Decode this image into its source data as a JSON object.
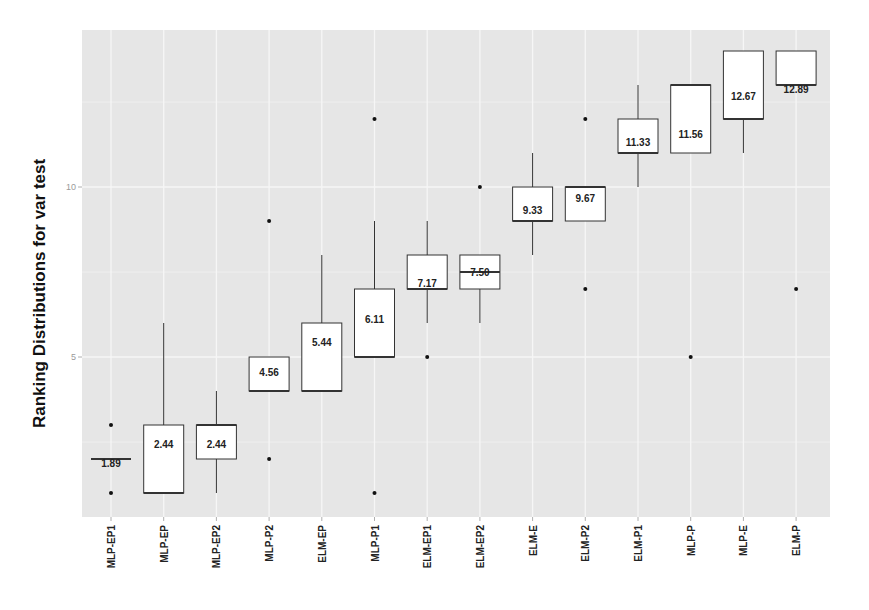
{
  "chart_data": {
    "type": "boxplot",
    "title": "",
    "xlabel": "",
    "ylabel": "Ranking Distributions for var test",
    "ylim": [
      0.3,
      14.5
    ],
    "yticks": [
      5,
      10
    ],
    "grid": true,
    "legend": null,
    "categories": [
      "MLP-EP1",
      "MLP-EP",
      "MLP-EP2",
      "MLP-P2",
      "ELM-EP",
      "MLP-P1",
      "ELM-EP1",
      "ELM-EP2",
      "ELM-E",
      "ELM-P2",
      "ELM-P1",
      "MLP-P",
      "MLP-E",
      "ELM-P"
    ],
    "boxes": [
      {
        "name": "MLP-EP1",
        "q1": 2,
        "median": 2,
        "q3": 2,
        "whisker_low": 2,
        "whisker_high": 2,
        "outliers": [
          1,
          3
        ],
        "mean_label": "1.89"
      },
      {
        "name": "MLP-EP",
        "q1": 1,
        "median": 1,
        "q3": 3,
        "whisker_low": 1,
        "whisker_high": 6,
        "outliers": [],
        "mean_label": "2.44"
      },
      {
        "name": "MLP-EP2",
        "q1": 2,
        "median": 3,
        "q3": 3,
        "whisker_low": 1,
        "whisker_high": 4,
        "outliers": [],
        "mean_label": "2.44"
      },
      {
        "name": "MLP-P2",
        "q1": 4,
        "median": 4,
        "q3": 5,
        "whisker_low": 4,
        "whisker_high": 5,
        "outliers": [
          2,
          9
        ],
        "mean_label": "4.56"
      },
      {
        "name": "ELM-EP",
        "q1": 4,
        "median": 4,
        "q3": 6,
        "whisker_low": 4,
        "whisker_high": 8,
        "outliers": [],
        "mean_label": "5.44"
      },
      {
        "name": "MLP-P1",
        "q1": 5,
        "median": 5,
        "q3": 7,
        "whisker_low": 5,
        "whisker_high": 9,
        "outliers": [
          1,
          12
        ],
        "mean_label": "6.11"
      },
      {
        "name": "ELM-EP1",
        "q1": 7,
        "median": 7,
        "q3": 8,
        "whisker_low": 6,
        "whisker_high": 9,
        "outliers": [
          5
        ],
        "mean_label": "7.17"
      },
      {
        "name": "ELM-EP2",
        "q1": 7,
        "median": 7.5,
        "q3": 8,
        "whisker_low": 6,
        "whisker_high": 8,
        "outliers": [
          10
        ],
        "mean_label": "7.50"
      },
      {
        "name": "ELM-E",
        "q1": 9,
        "median": 9,
        "q3": 10,
        "whisker_low": 8,
        "whisker_high": 11,
        "outliers": [],
        "mean_label": "9.33"
      },
      {
        "name": "ELM-P2",
        "q1": 9,
        "median": 10,
        "q3": 10,
        "whisker_low": 9,
        "whisker_high": 10,
        "outliers": [
          7,
          12
        ],
        "mean_label": "9.67"
      },
      {
        "name": "ELM-P1",
        "q1": 11,
        "median": 11,
        "q3": 12,
        "whisker_low": 10,
        "whisker_high": 13,
        "outliers": [],
        "mean_label": "11.33"
      },
      {
        "name": "MLP-P",
        "q1": 11,
        "median": 13,
        "q3": 13,
        "whisker_low": 11,
        "whisker_high": 13,
        "outliers": [
          5
        ],
        "mean_label": "11.56"
      },
      {
        "name": "MLP-E",
        "q1": 12,
        "median": 12,
        "q3": 14,
        "whisker_low": 11,
        "whisker_high": 14,
        "outliers": [],
        "mean_label": "12.67"
      },
      {
        "name": "ELM-P",
        "q1": 13,
        "median": 13,
        "q3": 14,
        "whisker_low": 13,
        "whisker_high": 14,
        "outliers": [
          7
        ],
        "mean_label": "12.89"
      }
    ]
  },
  "colors": {
    "panel_background": "#e6e6e6",
    "gridline": "#f6f6f6",
    "box_fill": "#ffffff",
    "box_stroke": "#333333",
    "point": "#111111"
  }
}
